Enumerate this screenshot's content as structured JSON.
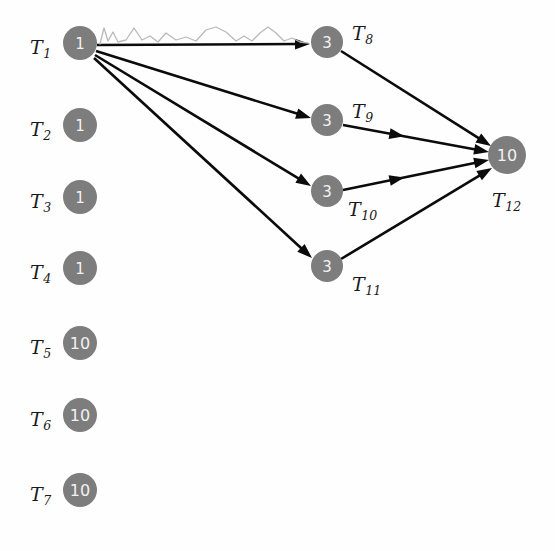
{
  "figure": {
    "background_color": "#fefefe",
    "node_color": "#7d7d7d",
    "node_text_color": "#f2f2f2",
    "edge_color": "#0b0b0b",
    "squiggle_color": "#b9b9b9"
  },
  "nodes": [
    {
      "id": "T1",
      "label": "T",
      "sub": "1",
      "value": "1",
      "cx": 80,
      "cy": 43,
      "r": 17,
      "label_x": 30,
      "label_y": 47,
      "label_pos": "left"
    },
    {
      "id": "T2",
      "label": "T",
      "sub": "2",
      "value": "1",
      "cx": 80,
      "cy": 125,
      "r": 17,
      "label_x": 30,
      "label_y": 129,
      "label_pos": "left"
    },
    {
      "id": "T3",
      "label": "T",
      "sub": "3",
      "value": "1",
      "cx": 80,
      "cy": 197,
      "r": 17,
      "label_x": 30,
      "label_y": 201,
      "label_pos": "left"
    },
    {
      "id": "T4",
      "label": "T",
      "sub": "4",
      "value": "1",
      "cx": 80,
      "cy": 268,
      "r": 17,
      "label_x": 30,
      "label_y": 272,
      "label_pos": "left"
    },
    {
      "id": "T5",
      "label": "T",
      "sub": "5",
      "value": "10",
      "cx": 80,
      "cy": 343,
      "r": 17,
      "label_x": 30,
      "label_y": 347,
      "label_pos": "left"
    },
    {
      "id": "T6",
      "label": "T",
      "sub": "6",
      "value": "10",
      "cx": 80,
      "cy": 415,
      "r": 17,
      "label_x": 30,
      "label_y": 419,
      "label_pos": "left"
    },
    {
      "id": "T7",
      "label": "T",
      "sub": "7",
      "value": "10",
      "cx": 80,
      "cy": 490,
      "r": 17,
      "label_x": 30,
      "label_y": 494,
      "label_pos": "left"
    },
    {
      "id": "T8",
      "label": "T",
      "sub": "8",
      "value": "3",
      "cx": 327,
      "cy": 42,
      "r": 16,
      "label_x": 352,
      "label_y": 33,
      "label_pos": "upper-right"
    },
    {
      "id": "T9",
      "label": "T",
      "sub": "9",
      "value": "3",
      "cx": 327,
      "cy": 120,
      "r": 16,
      "label_x": 352,
      "label_y": 111,
      "label_pos": "upper-right"
    },
    {
      "id": "T10",
      "label": "T",
      "sub": "10",
      "value": "3",
      "cx": 327,
      "cy": 191,
      "r": 16,
      "label_x": 348,
      "label_y": 209,
      "label_pos": "lower-right"
    },
    {
      "id": "T11",
      "label": "T",
      "sub": "11",
      "value": "3",
      "cx": 327,
      "cy": 266,
      "r": 16,
      "label_x": 352,
      "label_y": 284,
      "label_pos": "lower-right"
    },
    {
      "id": "T12",
      "label": "T",
      "sub": "12",
      "value": "10",
      "cx": 507,
      "cy": 155,
      "r": 19,
      "label_x": 492,
      "label_y": 200,
      "label_pos": "below"
    }
  ],
  "edges": [
    {
      "id": "e1",
      "from": "T1",
      "to": "T8",
      "x1": 97,
      "y1": 45,
      "x2": 310,
      "y2": 44,
      "mid_arrow": false
    },
    {
      "id": "e2",
      "from": "T1",
      "to": "T9",
      "x1": 96,
      "y1": 51,
      "x2": 311,
      "y2": 118,
      "mid_arrow": false
    },
    {
      "id": "e3",
      "from": "T1",
      "to": "T10",
      "x1": 95,
      "y1": 55,
      "x2": 311,
      "y2": 186,
      "mid_arrow": false
    },
    {
      "id": "e4",
      "from": "T1",
      "to": "T11",
      "x1": 94,
      "y1": 58,
      "x2": 312,
      "y2": 258,
      "mid_arrow": false
    },
    {
      "id": "e5",
      "from": "T8",
      "to": "T12",
      "x1": 341,
      "y1": 51,
      "x2": 491,
      "y2": 146,
      "mid_arrow": false
    },
    {
      "id": "e6",
      "from": "T9",
      "to": "T12",
      "x1": 343,
      "y1": 125,
      "x2": 489,
      "y2": 152,
      "mid_arrow": true
    },
    {
      "id": "e7",
      "from": "T10",
      "to": "T12",
      "x1": 343,
      "y1": 190,
      "x2": 489,
      "y2": 160,
      "mid_arrow": true
    },
    {
      "id": "e8",
      "from": "T11",
      "to": "T12",
      "x1": 341,
      "y1": 259,
      "x2": 492,
      "y2": 168,
      "mid_arrow": false
    }
  ],
  "decorations": {
    "squiggle": {
      "id": "scan-squiggle",
      "description": "faint hand-drawn wavy line above the T1 to T8 edge",
      "path": "M 100 44 L 104 28 L 108 41 L 113 32 L 118 42 L 126 40 L 134 28 L 142 40 L 150 36 L 158 42 L 166 33 L 176 40 L 186 37 L 196 41 L 206 30 L 216 27 L 226 32 L 236 41 L 244 36 L 252 41 L 260 33 L 268 27 L 276 33 L 284 41 L 292 38 L 300 42 L 308 43"
    }
  }
}
